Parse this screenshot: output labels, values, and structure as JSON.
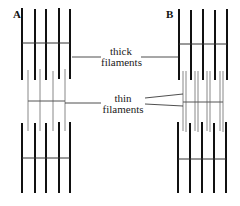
{
  "panels": [
    {
      "letter": "A"
    },
    {
      "letter": "B"
    }
  ],
  "labels": {
    "thick_line1": "thick",
    "thick_line2": "filaments",
    "thin_line1": "thin",
    "thin_line2": "filaments"
  },
  "colors": {
    "thick": "#111111",
    "thin": "#777777",
    "background": "#ffffff"
  }
}
